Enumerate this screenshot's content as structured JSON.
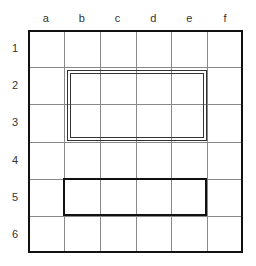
{
  "grid": {
    "columns": [
      "a",
      "b",
      "c",
      "d",
      "e",
      "f"
    ],
    "rows": [
      "1",
      "2",
      "3",
      "4",
      "5",
      "6"
    ],
    "colors": {
      "outer_border": "#111111",
      "grid_line": "#888888",
      "box_line": "#333333"
    }
  },
  "highlights": [
    {
      "style": "double",
      "from_col": "b",
      "to_col": "e",
      "from_row": "2",
      "to_row": "3"
    },
    {
      "style": "bold",
      "from_col": "b",
      "to_col": "e",
      "from_row": "5",
      "to_row": "5"
    }
  ]
}
